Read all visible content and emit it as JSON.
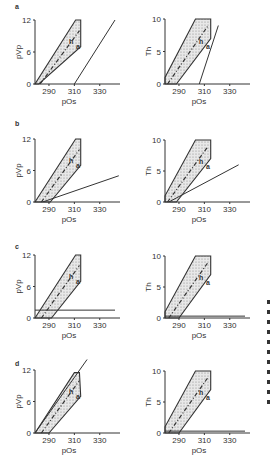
{
  "figure": {
    "panels": [
      "a",
      "b",
      "c",
      "d"
    ],
    "side_marks_count": 11
  },
  "chart_data": [
    {
      "panel": "a",
      "type": "line",
      "xlabel": "pOs",
      "ylabel": "pVp",
      "xticks": [
        290,
        310,
        330
      ],
      "yticks": [
        0,
        6,
        12
      ],
      "xlim": [
        279,
        342
      ],
      "ylim": [
        0,
        12
      ],
      "region_polygon": [
        [
          279,
          0
        ],
        [
          282,
          0
        ],
        [
          315,
          7
        ],
        [
          315,
          12
        ],
        [
          311,
          12
        ],
        [
          279,
          0
        ]
      ],
      "regression_line": [
        [
          283,
          0
        ],
        [
          314,
          10
        ]
      ],
      "reference_line": {
        "from": [
          310,
          0
        ],
        "to": [
          342,
          12
        ]
      },
      "labels": [
        "h",
        "a"
      ]
    },
    {
      "panel": "a",
      "type": "line",
      "xlabel": "pOs",
      "ylabel": "Th",
      "xticks": [
        290,
        310,
        330
      ],
      "yticks": [
        0,
        5,
        10
      ],
      "xlim": [
        279,
        342
      ],
      "ylim": [
        0,
        10
      ],
      "region_polygon": [
        [
          279,
          0
        ],
        [
          279,
          1
        ],
        [
          303,
          10
        ],
        [
          315,
          10
        ],
        [
          315,
          7
        ],
        [
          288,
          0
        ]
      ],
      "regression_line": [
        [
          281,
          0
        ],
        [
          313,
          9
        ]
      ],
      "reference_line": {
        "from": [
          306,
          0
        ],
        "to": [
          321,
          9
        ]
      },
      "labels": [
        "h",
        "a"
      ]
    },
    {
      "panel": "b",
      "type": "line",
      "xlabel": "pOs",
      "ylabel": "pVp",
      "xticks": [
        290,
        310,
        330
      ],
      "yticks": [
        0,
        6,
        12
      ],
      "xlim": [
        279,
        342
      ],
      "ylim": [
        0,
        12
      ],
      "region_polygon": [
        [
          279,
          0
        ],
        [
          311,
          12
        ],
        [
          315,
          12
        ],
        [
          315,
          7
        ],
        [
          291,
          0
        ]
      ],
      "regression_line": [
        [
          284,
          0
        ],
        [
          314,
          10
        ]
      ],
      "reference_line": {
        "from": [
          285,
          0
        ],
        "to": [
          345,
          5
        ]
      },
      "labels": [
        "h",
        "a"
      ]
    },
    {
      "panel": "b",
      "type": "line",
      "xlabel": "pOs",
      "ylabel": "Th",
      "xticks": [
        290,
        310,
        330
      ],
      "yticks": [
        0,
        5,
        10
      ],
      "xlim": [
        279,
        342
      ],
      "ylim": [
        0,
        10
      ],
      "region_polygon": [
        [
          279,
          0
        ],
        [
          279,
          1
        ],
        [
          303,
          10
        ],
        [
          315,
          10
        ],
        [
          315,
          7
        ],
        [
          288,
          0
        ]
      ],
      "regression_line": [
        [
          281,
          0
        ],
        [
          313,
          9
        ]
      ],
      "reference_line": {
        "from": [
          282,
          0
        ],
        "to": [
          337,
          6
        ]
      },
      "labels": [
        "h",
        "a"
      ]
    },
    {
      "panel": "c",
      "type": "line",
      "xlabel": "pOs",
      "ylabel": "pVp",
      "xticks": [
        290,
        310,
        330
      ],
      "yticks": [
        0,
        6,
        12
      ],
      "xlim": [
        279,
        342
      ],
      "ylim": [
        0,
        12
      ],
      "region_polygon": [
        [
          279,
          0
        ],
        [
          311,
          12
        ],
        [
          315,
          12
        ],
        [
          315,
          7
        ],
        [
          292,
          0
        ]
      ],
      "regression_line": [
        [
          284,
          0
        ],
        [
          314,
          10
        ]
      ],
      "reference_line": {
        "from": [
          279,
          1.5
        ],
        "to": [
          342,
          1.5
        ]
      },
      "labels": [
        "h",
        "a"
      ]
    },
    {
      "panel": "c",
      "type": "line",
      "xlabel": "pOs",
      "ylabel": "Th",
      "xticks": [
        290,
        310,
        330
      ],
      "yticks": [
        0,
        5,
        10
      ],
      "xlim": [
        279,
        342
      ],
      "ylim": [
        0,
        10
      ],
      "region_polygon": [
        [
          279,
          0
        ],
        [
          279,
          1
        ],
        [
          303,
          10
        ],
        [
          315,
          10
        ],
        [
          315,
          7
        ],
        [
          290,
          0
        ]
      ],
      "regression_line": [
        [
          282,
          0
        ],
        [
          313,
          9
        ]
      ],
      "reference_line": {
        "from": [
          279,
          0.3
        ],
        "to": [
          342,
          0.3
        ]
      },
      "labels": [
        "h",
        "a"
      ]
    },
    {
      "panel": "d",
      "type": "line",
      "xlabel": "pOs",
      "ylabel": "pVp",
      "xticks": [
        290,
        310,
        330
      ],
      "yticks": [
        0,
        6,
        12
      ],
      "xlim": [
        279,
        342
      ],
      "ylim": [
        0,
        12
      ],
      "region_polygon": [
        [
          279,
          0
        ],
        [
          310,
          11.5
        ],
        [
          314,
          11.5
        ],
        [
          315,
          7
        ],
        [
          290,
          0
        ]
      ],
      "regression_line": [
        [
          284,
          0
        ],
        [
          314,
          10
        ]
      ],
      "reference_line": {
        "from": [
          279,
          0
        ],
        "to": [
          320,
          14
        ]
      },
      "labels": [
        "h",
        "a"
      ]
    },
    {
      "panel": "d",
      "type": "line",
      "xlabel": "pOs",
      "ylabel": "Th",
      "xticks": [
        290,
        310,
        330
      ],
      "yticks": [
        0,
        5,
        10
      ],
      "xlim": [
        279,
        342
      ],
      "ylim": [
        0,
        10
      ],
      "region_polygon": [
        [
          279,
          0
        ],
        [
          279,
          1
        ],
        [
          303,
          10
        ],
        [
          315,
          10
        ],
        [
          315,
          7
        ],
        [
          290,
          0
        ]
      ],
      "regression_line": [
        [
          282,
          0
        ],
        [
          313,
          9
        ]
      ],
      "reference_line": {
        "from": [
          279,
          0.3
        ],
        "to": [
          342,
          0.3
        ]
      },
      "labels": [
        "h",
        "a"
      ]
    }
  ]
}
